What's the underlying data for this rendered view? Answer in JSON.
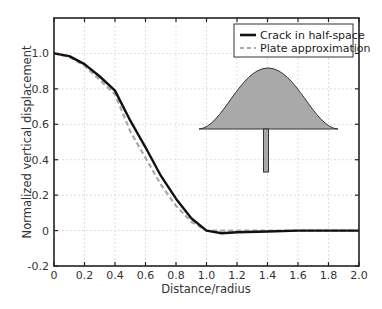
{
  "chart_data": {
    "type": "line",
    "title": "",
    "xlabel": "Distance/radius",
    "ylabel": "Normalized vertical displacement",
    "xlim": [
      0,
      2.0
    ],
    "ylim": [
      -0.2,
      1.2
    ],
    "xticks": [
      "0",
      "0.2",
      "0.4",
      "0.6",
      "0.8",
      "1.0",
      "1.2",
      "1.4",
      "1.6",
      "1.8",
      "2.0"
    ],
    "yticks": [
      "-0.2",
      "0",
      "0.2",
      "0.4",
      "0.6",
      "0.8",
      "1.0"
    ],
    "grid": true,
    "legend_position": "upper right",
    "series": [
      {
        "name": "Crack in half-space",
        "style": "solid",
        "color": "#111111",
        "x": [
          0,
          0.1,
          0.2,
          0.3,
          0.4,
          0.5,
          0.6,
          0.7,
          0.8,
          0.9,
          1.0,
          1.1,
          1.2,
          1.4,
          1.6,
          1.8,
          2.0
        ],
        "y": [
          1.0,
          0.985,
          0.94,
          0.87,
          0.79,
          0.62,
          0.47,
          0.31,
          0.18,
          0.07,
          0.0,
          -0.015,
          -0.01,
          -0.005,
          0.0,
          0.0,
          0.0
        ]
      },
      {
        "name": "Plate approximation",
        "style": "dashed",
        "color": "#a8a8a8",
        "x": [
          0,
          0.1,
          0.2,
          0.3,
          0.4,
          0.5,
          0.6,
          0.7,
          0.8,
          0.9,
          1.0,
          1.2,
          1.4,
          1.6,
          1.8,
          2.0
        ],
        "y": [
          1.0,
          0.98,
          0.93,
          0.85,
          0.77,
          0.56,
          0.41,
          0.26,
          0.14,
          0.05,
          0.0,
          0.0,
          0.0,
          0.0,
          0.0,
          0.0
        ]
      }
    ],
    "annotations": [
      {
        "type": "inset-diagram",
        "description": "gray bell-shaped crack profile with vertical feeder stem"
      }
    ]
  },
  "legend": {
    "items": [
      {
        "label": "Crack in half-space"
      },
      {
        "label": "Plate approximation"
      }
    ]
  }
}
